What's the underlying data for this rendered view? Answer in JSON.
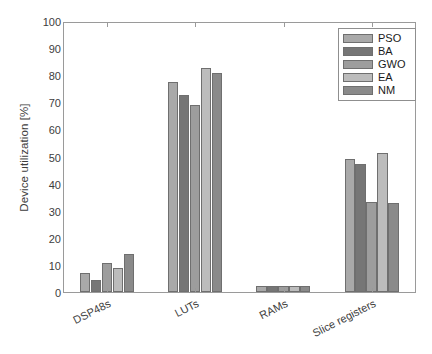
{
  "chart_data": {
    "type": "bar",
    "title": "",
    "subtitle": "",
    "xlabel": "",
    "ylabel": "Device utilization [%]",
    "categories": [
      "DSP48s",
      "LUTs",
      "RAMs",
      "Slice registers"
    ],
    "series": [
      {
        "name": "PSO",
        "color": "#a9a9a9",
        "values": [
          7.2,
          77.5,
          2.2,
          49.1
        ]
      },
      {
        "name": "BA",
        "color": "#767676",
        "values": [
          4.3,
          72.8,
          2.2,
          47.2
        ]
      },
      {
        "name": "GWO",
        "color": "#9d9d9d",
        "values": [
          10.8,
          69.0,
          2.2,
          33.3
        ]
      },
      {
        "name": "EA",
        "color": "#bcbcbc",
        "values": [
          8.8,
          82.5,
          2.2,
          51.4
        ]
      },
      {
        "name": "NM",
        "color": "#8a8a8a",
        "values": [
          14.1,
          80.7,
          2.2,
          32.9
        ]
      }
    ],
    "ylim": [
      0,
      100
    ],
    "yticks": [
      0,
      10,
      20,
      30,
      40,
      50,
      60,
      70,
      80,
      90,
      100
    ],
    "ytick_labels": [
      "0",
      "10",
      "20",
      "30",
      "40",
      "50",
      "60",
      "70",
      "80",
      "90",
      "100"
    ],
    "grid": false,
    "legend_position": "top-right",
    "legend_entries": [
      "PSO",
      "BA",
      "GWO",
      "EA",
      "NM"
    ],
    "bar_edge_color": "#6f6f6f",
    "axis_color": "#9a9a9a",
    "text_color": "#3d3d3d",
    "xtick_rotation_deg": -27
  }
}
